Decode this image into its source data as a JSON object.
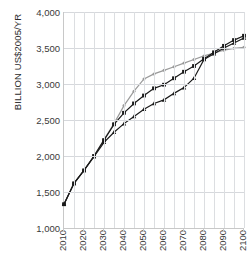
{
  "chart_data": {
    "type": "line",
    "title": "",
    "xlabel": "",
    "ylabel": "BILLION US$2005/YR",
    "xlim": [
      2010,
      2100
    ],
    "ylim": [
      1000,
      4000
    ],
    "ytick_labels": [
      "1,000",
      "1,500",
      "2,000",
      "2,500",
      "3,000",
      "3,500",
      "4,000"
    ],
    "ytick_values": [
      1000,
      1500,
      2000,
      2500,
      3000,
      3500,
      4000
    ],
    "xtick_labels": [
      "2010",
      "2020",
      "2030",
      "2040",
      "2050",
      "2060",
      "2070",
      "2080",
      "2090",
      "2100"
    ],
    "xtick_values": [
      2010,
      2020,
      2030,
      2040,
      2050,
      2060,
      2070,
      2080,
      2090,
      2100
    ],
    "grid": "both-major-minor",
    "grid_x_step": 5,
    "legend": "none",
    "x": [
      2010,
      2015,
      2020,
      2025,
      2030,
      2035,
      2040,
      2045,
      2050,
      2055,
      2060,
      2065,
      2070,
      2075,
      2080,
      2085,
      2090,
      2095,
      2100
    ],
    "series": [
      {
        "name": "series-gray-circle",
        "color": "#9a9a9a",
        "marker": "circle",
        "values": [
          1330,
          1620,
          1800,
          2000,
          2230,
          2450,
          2700,
          2900,
          3070,
          3140,
          3190,
          3240,
          3290,
          3340,
          3390,
          3430,
          3470,
          3495,
          3510
        ]
      },
      {
        "name": "series-black-square",
        "color": "#1a1a1a",
        "marker": "square",
        "values": [
          1330,
          1620,
          1800,
          2000,
          2220,
          2440,
          2600,
          2730,
          2840,
          2940,
          2990,
          3080,
          3170,
          3250,
          3350,
          3440,
          3530,
          3610,
          3670
        ]
      },
      {
        "name": "series-black-triangle",
        "color": "#1a1a1a",
        "marker": "triangle",
        "values": [
          1330,
          1620,
          1800,
          1990,
          2190,
          2330,
          2450,
          2550,
          2650,
          2730,
          2780,
          2870,
          2950,
          3080,
          3340,
          3420,
          3500,
          3570,
          3640
        ]
      }
    ]
  }
}
